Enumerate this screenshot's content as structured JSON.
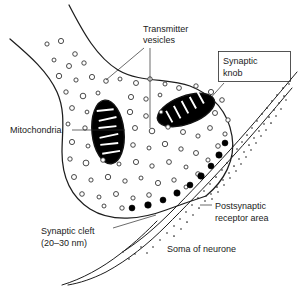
{
  "figure": {
    "type": "labelled-biological-diagram"
  },
  "labels": {
    "transmitter_vesicles": "Transmitter\nvesicles",
    "transmitter_vesicles_line1": "Transmitter",
    "transmitter_vesicles_line2": "vesicles",
    "synaptic_knob_line1": "Synaptic",
    "synaptic_knob_line2": "knob",
    "mitochondria": "Mitochondria",
    "synaptic_cleft_line1": "Synaptic cleft",
    "synaptic_cleft_line2": "(20–30 nm)",
    "postsynaptic_line1": "Postsynaptic",
    "postsynaptic_line2": "receptor area",
    "soma": "Soma of neurone"
  },
  "measurements": {
    "synaptic_cleft_width": "20–30 nm"
  },
  "colors": {
    "background": "#ffffff",
    "ink": "#1d1d1d",
    "text": "#1a1a1a",
    "vesicle_fill": "#ffffff",
    "docked_vesicle_fill": "#000000",
    "mitochondria_fill": "#000000",
    "cristae": "#ffffff"
  },
  "structures": {
    "open_vesicle_count": 62,
    "docked_vesicle_count": 9,
    "mitochondria_count": 2
  }
}
